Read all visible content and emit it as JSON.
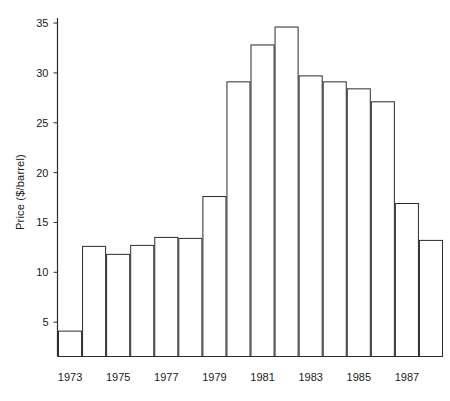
{
  "chart_data": {
    "type": "bar",
    "title": "",
    "subtitle": "",
    "xlabel": "",
    "ylabel": "Price ($/barrel)",
    "categories": [
      "1973",
      "1974",
      "1975",
      "1976",
      "1977",
      "1978",
      "1979",
      "1980",
      "1981",
      "1982",
      "1983",
      "1984",
      "1985",
      "1986",
      "1987",
      "1988"
    ],
    "values": [
      4.1,
      12.6,
      11.8,
      12.7,
      13.5,
      13.4,
      17.6,
      29.1,
      32.8,
      34.6,
      29.7,
      29.1,
      28.4,
      27.1,
      16.9,
      13.2
    ],
    "ylim": [
      0,
      36
    ],
    "xlim_labels_shown": [
      "1973",
      "1975",
      "1977",
      "1979",
      "1981",
      "1983",
      "1985",
      "1987"
    ],
    "ytick_labels": [
      "5",
      "10",
      "15",
      "20",
      "25",
      "30",
      "35"
    ],
    "ytick_values": [
      5,
      10,
      15,
      20,
      25,
      30,
      35
    ],
    "grid": false,
    "legend": false,
    "legend_position": "none",
    "bar_fill_color": "#ffffff",
    "bar_edge_color": "#2b2b2b",
    "axis_color": "#2b2b2b",
    "background_color": "#ffffff"
  }
}
